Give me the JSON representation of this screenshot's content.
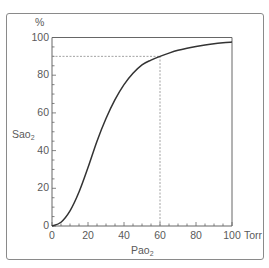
{
  "chart_data": {
    "type": "line",
    "title": "",
    "xlabel": "PaO2",
    "xlabel_main": "Pao",
    "xlabel_sub": "2",
    "xunit": "Torr",
    "ylabel": "SaO2",
    "ylabel_main": "Sao",
    "ylabel_sub": "2",
    "yunit": "%",
    "xlim": [
      0,
      100
    ],
    "ylim": [
      0,
      100
    ],
    "x_ticks": [
      "0",
      "20",
      "40",
      "60",
      "80",
      "100"
    ],
    "y_ticks": [
      "0",
      "20",
      "40",
      "60",
      "80",
      "100"
    ],
    "x_minor_tick_step": 5,
    "y_minor_tick_step": 5,
    "grid": false,
    "legend": null,
    "series": [
      {
        "name": "Oxyhemoglobin dissociation curve",
        "x": [
          0,
          5,
          10,
          15,
          20,
          25,
          30,
          35,
          40,
          45,
          50,
          55,
          60,
          65,
          70,
          75,
          80,
          85,
          90,
          95,
          100
        ],
        "y": [
          0,
          2,
          8,
          18,
          31,
          45,
          57,
          67,
          75,
          81,
          85.5,
          88,
          90,
          91.7,
          93.2,
          94.3,
          95.2,
          96,
          96.7,
          97.2,
          97.6
        ]
      }
    ],
    "reference_lines": [
      {
        "type": "vertical",
        "x": 60,
        "from_y": 0,
        "to_y": 90,
        "style": "dotted"
      },
      {
        "type": "horizontal",
        "y": 90,
        "from_x": 0,
        "to_x": 60,
        "style": "dotted"
      }
    ]
  },
  "labels": {
    "y_unit": "%",
    "x_unit": "Torr",
    "y_title_main": "Sao",
    "y_title_sub": "2",
    "x_title_main": "Pao",
    "x_title_sub": "2"
  },
  "colors": {
    "curve": "#333333",
    "axis": "#666666",
    "frame": "#8a8a8a",
    "dashed": "#8a8a8a",
    "text": "#5a5a5a"
  }
}
